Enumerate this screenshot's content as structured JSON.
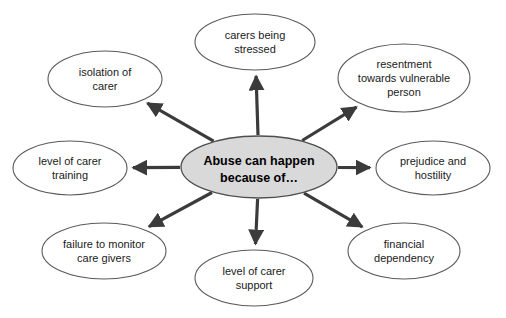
{
  "diagram": {
    "type": "radial-spider-diagram",
    "background_color": "#ffffff",
    "center": {
      "name": "abuse-causes-center",
      "lines": [
        "Abuse can happen",
        "because of…"
      ],
      "line1": "Abuse can happen",
      "line2": "because of…",
      "fill_color": "#d9d9d9",
      "stroke_color": "#4d4d4d",
      "cx": 259,
      "cy": 167,
      "rx": 78,
      "ry": 31
    },
    "arrow_color": "#3b3b3b",
    "node_fill_color": "#ffffff",
    "node_stroke_color": "#5a5a5a",
    "nodes": [
      {
        "name": "node-carers-being-stressed",
        "lines": [
          "carers being",
          "stressed"
        ],
        "line1": "carers being",
        "line2": "stressed",
        "cx": 255,
        "cy": 42,
        "rx": 60,
        "ry": 28,
        "direction": "up"
      },
      {
        "name": "node-resentment-towards-vulnerable-person",
        "lines": [
          "resentment",
          "towards vulnerable",
          "person"
        ],
        "line1": "resentment",
        "line2": "towards vulnerable",
        "line3": "person",
        "cx": 404,
        "cy": 78,
        "rx": 66,
        "ry": 34,
        "direction": "up-right"
      },
      {
        "name": "node-prejudice-and-hostility",
        "lines": [
          "prejudice and",
          "hostility"
        ],
        "line1": "prejudice and",
        "line2": "hostility",
        "cx": 433,
        "cy": 168,
        "rx": 57,
        "ry": 27,
        "direction": "right"
      },
      {
        "name": "node-financial-dependency",
        "lines": [
          "financial",
          "dependency"
        ],
        "line1": "financial",
        "line2": "dependency",
        "cx": 404,
        "cy": 251,
        "rx": 56,
        "ry": 28,
        "direction": "down-right"
      },
      {
        "name": "node-level-of-carer-support",
        "lines": [
          "level of carer",
          "support"
        ],
        "line1": "level of carer",
        "line2": "support",
        "cx": 254,
        "cy": 278,
        "rx": 59,
        "ry": 28,
        "direction": "down"
      },
      {
        "name": "node-failure-to-monitor-care-givers",
        "lines": [
          "failure to monitor",
          "care givers"
        ],
        "line1": "failure to monitor",
        "line2": "care givers",
        "cx": 104,
        "cy": 251,
        "rx": 62,
        "ry": 28,
        "direction": "down-left"
      },
      {
        "name": "node-level-of-carer-training",
        "lines": [
          "level of carer",
          "training"
        ],
        "line1": "level of carer",
        "line2": "training",
        "cx": 70,
        "cy": 168,
        "rx": 57,
        "ry": 27,
        "direction": "left"
      },
      {
        "name": "node-isolation-of-carer",
        "lines": [
          "isolation of",
          "carer"
        ],
        "line1": "isolation of",
        "line2": "carer",
        "cx": 105,
        "cy": 79,
        "rx": 57,
        "ry": 28,
        "direction": "up-left"
      }
    ]
  }
}
